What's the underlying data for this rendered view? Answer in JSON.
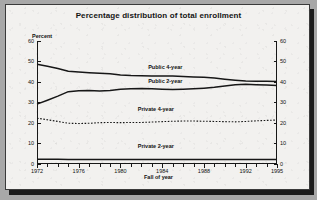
{
  "figure": {
    "title": "Percentage distribution of total enrollment",
    "y_axis_label": "Percent",
    "x_axis_label": "Fall of year"
  },
  "chart_data": {
    "type": "line",
    "title": "Percentage distribution of total enrollment",
    "xlabel": "Fall of year",
    "ylabel": "Percent",
    "xlim": [
      1972,
      1995
    ],
    "ylim": [
      0,
      60
    ],
    "ytick_labels": [
      "0",
      "10",
      "20",
      "30",
      "40",
      "50",
      "60"
    ],
    "yticks": [
      0,
      10,
      20,
      30,
      40,
      50,
      60
    ],
    "xtick_labels": [
      "1972",
      "1976",
      "1980",
      "1984",
      "1988",
      "1992",
      "1995"
    ],
    "xticks": [
      1972,
      1976,
      1980,
      1984,
      1988,
      1992,
      1995
    ],
    "grid": false,
    "legend": "inline-labels",
    "x": [
      1972,
      1973,
      1974,
      1975,
      1976,
      1977,
      1978,
      1979,
      1980,
      1981,
      1982,
      1983,
      1984,
      1985,
      1986,
      1987,
      1988,
      1989,
      1990,
      1991,
      1992,
      1993,
      1994,
      1995
    ],
    "series": [
      {
        "name": "Public 4-year",
        "style": "solid",
        "values": [
          48.6,
          47.6,
          46.5,
          45.2,
          44.8,
          44.5,
          44.2,
          43.9,
          43.4,
          43.1,
          43.0,
          42.9,
          42.9,
          42.8,
          42.6,
          42.4,
          42.2,
          41.9,
          41.3,
          40.8,
          40.4,
          40.3,
          40.3,
          40.2
        ]
      },
      {
        "name": "Public 2-year",
        "style": "solid",
        "values": [
          29.1,
          31.0,
          33.0,
          35.2,
          35.6,
          35.7,
          35.5,
          35.8,
          36.4,
          36.6,
          36.7,
          36.6,
          36.4,
          36.3,
          36.4,
          36.6,
          36.9,
          37.3,
          38.0,
          38.6,
          38.8,
          38.6,
          38.4,
          38.2
        ]
      },
      {
        "name": "Private 4-year",
        "style": "dotted",
        "values": [
          22.2,
          21.4,
          20.6,
          19.7,
          19.6,
          19.7,
          20.0,
          20.1,
          20.0,
          20.1,
          20.1,
          20.3,
          20.5,
          20.7,
          20.8,
          20.8,
          20.7,
          20.6,
          20.5,
          20.4,
          20.6,
          20.9,
          21.1,
          21.3
        ]
      },
      {
        "name": "Private 2-year",
        "style": "solid",
        "values": [
          2.1,
          2.1,
          2.1,
          2.0,
          2.0,
          2.0,
          2.0,
          2.0,
          2.0,
          2.0,
          2.0,
          2.0,
          2.0,
          2.0,
          2.0,
          2.0,
          2.0,
          2.0,
          2.0,
          2.0,
          2.0,
          2.0,
          2.0,
          2.0
        ]
      }
    ],
    "annotations": [
      {
        "text": "Public 4-year",
        "x": 1984,
        "y": 47
      },
      {
        "text": "Public 2-year",
        "x": 1984,
        "y": 40
      },
      {
        "text": "Private 4-year",
        "x": 1983,
        "y": 26
      },
      {
        "text": "Private 2-year",
        "x": 1983,
        "y": 8
      }
    ]
  }
}
